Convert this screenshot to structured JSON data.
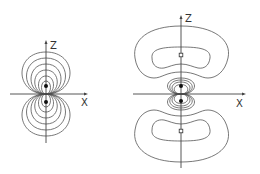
{
  "figures": [
    {
      "id": "left",
      "description": "Dipole-like nested contour loops tangent at origin",
      "axes": {
        "z_label": "Z",
        "x_label": "X"
      },
      "markers": [
        {
          "type": "filled-dot",
          "position": "upper"
        },
        {
          "type": "filled-dot",
          "position": "lower"
        }
      ],
      "contour_count_per_side": 6
    },
    {
      "id": "right",
      "description": "Central nested loops plus outer kidney-shaped lobes above and below",
      "axes": {
        "z_label": "Z",
        "x_label": "X"
      },
      "markers": [
        {
          "type": "open-square",
          "position": "upper-lobe"
        },
        {
          "type": "filled-dot",
          "position": "upper-center"
        },
        {
          "type": "filled-dot",
          "position": "lower-center"
        },
        {
          "type": "open-square",
          "position": "lower-lobe"
        }
      ],
      "central_contours_per_side": 4,
      "lobe_contours": 2
    }
  ],
  "colors": {
    "line": "#555555",
    "axis": "#444444",
    "background": "#ffffff"
  }
}
